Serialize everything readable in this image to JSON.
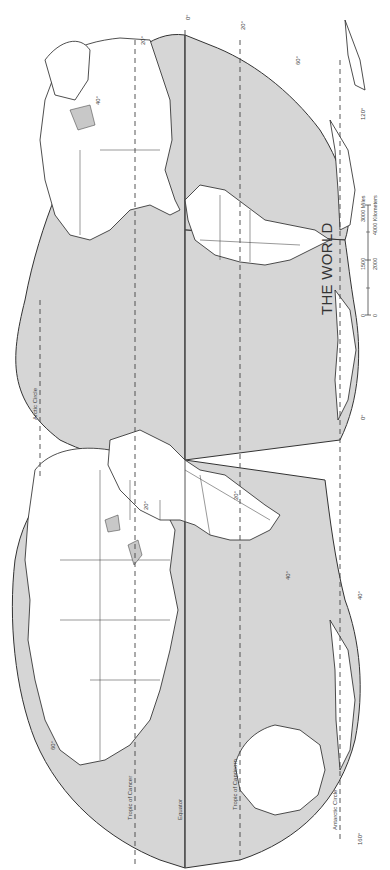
{
  "map": {
    "title": "THE WORLD",
    "projection": "interrupted homolosine (rotated 90°)",
    "colors": {
      "ocean": "#d6d6d6",
      "land": "#ffffff",
      "lines": "#333333",
      "background": "#ffffff"
    },
    "lines": {
      "equator": "Equator",
      "tropic_cancer": "Tropic of Cancer",
      "tropic_capricorn": "Tropic of Capricorn",
      "arctic_circle": "Arctic Circle",
      "antarctic_circle": "Antarctic Circle"
    },
    "latitude_labels": {
      "l0": "0°",
      "l20": "20°",
      "l40": "40°",
      "l60": "60°"
    },
    "longitude_labels": {
      "l0": "0°",
      "l40": "40°",
      "l120": "120°",
      "l160": "160°"
    },
    "scale": {
      "miles": {
        "zero": "0",
        "mid": "1500",
        "end": "3000 Miles"
      },
      "km": {
        "zero": "0",
        "mid": "2000",
        "end": "4000 Kilometers"
      }
    }
  }
}
